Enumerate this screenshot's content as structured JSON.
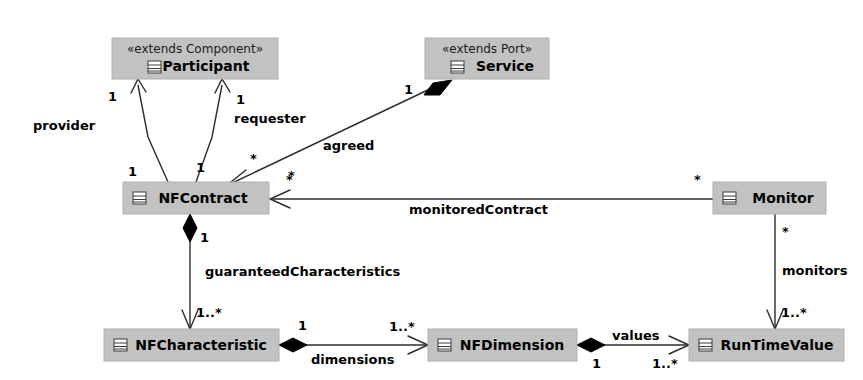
{
  "diagram": {
    "background_color": "#ffffff",
    "class_fill_color": "#c2c2c2",
    "line_color": "#2b2b2b",
    "classes": [
      {
        "id": "participant",
        "name": "Participant",
        "stereotype": "«extends Component»",
        "icon": "class-icon",
        "x": 112,
        "y": 38,
        "w": 166,
        "h": 41
      },
      {
        "id": "service",
        "name": "Service",
        "stereotype": "«extends Port»",
        "icon": "class-icon",
        "x": 425,
        "y": 38,
        "w": 124,
        "h": 41
      },
      {
        "id": "nfcontract",
        "name": "NFContract",
        "stereotype": "",
        "icon": "class-icon",
        "x": 123,
        "y": 182,
        "w": 146,
        "h": 32
      },
      {
        "id": "monitor",
        "name": "Monitor",
        "stereotype": "",
        "icon": "class-icon",
        "x": 713,
        "y": 182,
        "w": 113,
        "h": 32
      },
      {
        "id": "nfcharacteristic",
        "name": "NFCharacteristic",
        "stereotype": "",
        "icon": "class-icon",
        "x": 104,
        "y": 329,
        "w": 175,
        "h": 32
      },
      {
        "id": "nfdimension",
        "name": "NFDimension",
        "stereotype": "",
        "icon": "class-icon",
        "x": 428,
        "y": 329,
        "w": 149,
        "h": 32
      },
      {
        "id": "runtimevalue",
        "name": "RunTimeValue",
        "stereotype": "",
        "icon": "class-icon",
        "x": 689,
        "y": 329,
        "w": 155,
        "h": 32
      }
    ],
    "associations": [
      {
        "id": "provider",
        "label": "provider",
        "from": "nfcontract",
        "to": "participant",
        "source_multiplicity": "1",
        "target_multiplicity": "1",
        "end_style": "open-arrow"
      },
      {
        "id": "requester",
        "label": "requester",
        "from": "nfcontract",
        "to": "participant",
        "source_multiplicity": "1",
        "target_multiplicity": "1",
        "end_style": "open-arrow"
      },
      {
        "id": "agreed",
        "label": "agreed",
        "from": "service",
        "to": "nfcontract",
        "source_multiplicity": "1",
        "target_multiplicity": "*",
        "end_style": "composite-diamond-open-arrow"
      },
      {
        "id": "monitoredContract",
        "label": "monitoredContract",
        "from": "monitor",
        "to": "nfcontract",
        "source_multiplicity": "*",
        "target_multiplicity": "*",
        "end_style": "open-arrow"
      },
      {
        "id": "guaranteedCharacteristics",
        "label": "guaranteedCharacteristics",
        "from": "nfcontract",
        "to": "nfcharacteristic",
        "source_multiplicity": "1",
        "target_multiplicity": "1..*",
        "end_style": "composite-diamond-open-arrow"
      },
      {
        "id": "monitors",
        "label": "monitors",
        "from": "monitor",
        "to": "runtimevalue",
        "source_multiplicity": "*",
        "target_multiplicity": "1..*",
        "end_style": "open-arrow"
      },
      {
        "id": "dimensions",
        "label": "dimensions",
        "from": "nfcharacteristic",
        "to": "nfdimension",
        "source_multiplicity": "1",
        "target_multiplicity": "1..*",
        "end_style": "composite-diamond-open-arrow"
      },
      {
        "id": "values",
        "label": "values",
        "from": "nfdimension",
        "to": "runtimevalue",
        "source_multiplicity": "1",
        "target_multiplicity": "1..*",
        "end_style": "composite-diamond-open-arrow"
      }
    ],
    "labels": {
      "provider": "provider",
      "requester": "requester",
      "agreed": "agreed",
      "monitoredContract": "monitoredContract",
      "guaranteedCharacteristics": "guaranteedCharacteristics",
      "monitors": "monitors",
      "dimensions": "dimensions",
      "values": "values"
    },
    "multiplicities": {
      "provider_target": "1",
      "provider_source": "1",
      "requester_target": "1",
      "requester_source": "1",
      "agreed_service": "1",
      "agreed_star_upper": "*",
      "agreed_star_lower": "*",
      "monitoredContract_monitor": "*",
      "monitoredContract_contract": "*",
      "guaranteed_one": "1",
      "guaranteed_many": "1..*",
      "monitors_star": "*",
      "monitors_many": "1..*",
      "dimensions_one": "1",
      "dimensions_many": "1..*",
      "values_one": "1",
      "values_many": "1..*"
    }
  }
}
